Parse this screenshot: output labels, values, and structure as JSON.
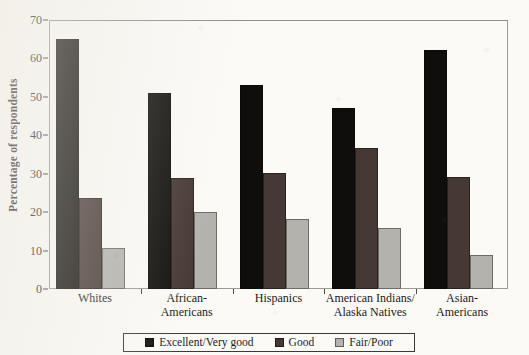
{
  "chart_data": {
    "type": "bar",
    "title": "",
    "subtitle": "",
    "xlabel": "",
    "ylabel": "Percentage of respondents",
    "ylim": [
      0,
      70
    ],
    "yticks": [
      0,
      10,
      20,
      30,
      40,
      50,
      60,
      70
    ],
    "grid": false,
    "legend_position": "bottom",
    "categories": [
      "Whites",
      "African-\nAmericans",
      "Hispanics",
      "American Indians/\nAlaska Natives",
      "Asian-\nAmericans"
    ],
    "series": [
      {
        "name": "Excellent/Very good",
        "color": "#100e0c",
        "values": [
          65.0,
          51.0,
          53.0,
          47.0,
          62.3
        ]
      },
      {
        "name": "Good",
        "color": "#463833",
        "values": [
          23.8,
          28.8,
          30.3,
          36.7,
          29.2
        ]
      },
      {
        "name": "Fair/Poor",
        "color": "#b4b2ad",
        "values": [
          10.8,
          20.0,
          18.3,
          16.0,
          8.9
        ]
      }
    ]
  },
  "legend": {
    "items": [
      {
        "label": "Excellent/Very good",
        "swatch": "series-0-swatch"
      },
      {
        "label": "Good",
        "swatch": "series-1-swatch"
      },
      {
        "label": "Fair/Poor",
        "swatch": "series-2-swatch"
      }
    ]
  },
  "axis": {
    "y_title": "Percentage of respondents"
  }
}
